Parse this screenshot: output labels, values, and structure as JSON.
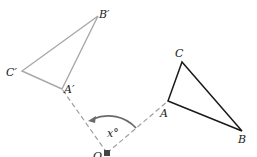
{
  "diagram": {
    "type": "rotation",
    "colors": {
      "original": "#1a1a1a",
      "image": "#a8a8a8",
      "guide": "#a0a0a0",
      "arc": "#6a6a6a",
      "center": "#444444"
    },
    "center": {
      "label": "O",
      "x": 107,
      "y": 153
    },
    "angle_label": "x°",
    "original_triangle": {
      "A": {
        "label": "A",
        "x": 168,
        "y": 101
      },
      "B": {
        "label": "B",
        "x": 242,
        "y": 131
      },
      "C": {
        "label": "C",
        "x": 182,
        "y": 62
      }
    },
    "image_triangle": {
      "A": {
        "label": "A′",
        "x": 62,
        "y": 89
      },
      "B": {
        "label": "B′",
        "x": 98,
        "y": 16
      },
      "C": {
        "label": "C′",
        "x": 22,
        "y": 71
      }
    }
  }
}
